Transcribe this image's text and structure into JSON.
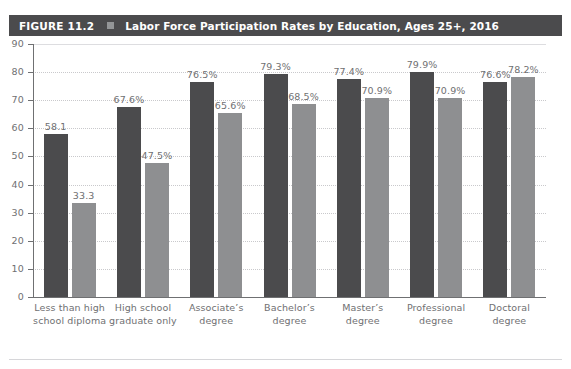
{
  "page": {
    "bleed_text": "",
    "bottom_rule": true
  },
  "header": {
    "figure_number": "FIGURE 11.2",
    "separator_icon": "square-bullet-icon",
    "title": "Labor Force Participation Rates by Education, Ages 25+, 2016",
    "bar_color": "#4b4b4d",
    "text_color": "#ffffff"
  },
  "legend": {
    "position": "bottom-center",
    "items": [
      {
        "label": "Men",
        "color": "#4b4b4d"
      },
      {
        "label": "Women",
        "color": "#8e8f91"
      }
    ]
  },
  "chart_data": {
    "type": "bar",
    "title": "Labor Force Participation Rates by Education, Ages 25+, 2016",
    "xlabel": "",
    "ylabel": "",
    "ylim": [
      0,
      90
    ],
    "yticks": [
      0,
      10,
      20,
      30,
      40,
      50,
      60,
      70,
      80,
      90
    ],
    "ytick_labels": [
      "0",
      "10",
      "20",
      "30",
      "40",
      "50",
      "60",
      "70",
      "80",
      "90"
    ],
    "grid": true,
    "legend": "bottom-center",
    "categories": [
      "Less than high school diploma",
      "High school graduate only",
      "Associate's degree",
      "Bachelor's degree",
      "Master's degree",
      "Professional degree",
      "Doctoral degree"
    ],
    "category_lines": [
      [
        "Less than high",
        "school diploma"
      ],
      [
        "High school",
        "graduate only"
      ],
      [
        "Associate’s",
        "degree"
      ],
      [
        "Bachelor’s",
        "degree"
      ],
      [
        "Master’s",
        "degree"
      ],
      [
        "Professional",
        "degree"
      ],
      [
        "Doctoral",
        "degree"
      ]
    ],
    "series": [
      {
        "name": "Men",
        "color": "#4b4b4d",
        "values": [
          58.1,
          67.6,
          76.5,
          79.3,
          77.4,
          79.9,
          76.6
        ],
        "data_labels": [
          "58.1",
          "67.6%",
          "76.5%",
          "79.3%",
          "77.4%",
          "79.9%",
          "76.6%"
        ]
      },
      {
        "name": "Women",
        "color": "#8e8f91",
        "values": [
          33.3,
          47.5,
          65.6,
          68.5,
          70.9,
          70.9,
          78.2
        ],
        "data_labels": [
          "33.3",
          "47.5%",
          "65.6%",
          "68.5%",
          "70.9%",
          "70.9%",
          "78.2%"
        ]
      }
    ]
  }
}
